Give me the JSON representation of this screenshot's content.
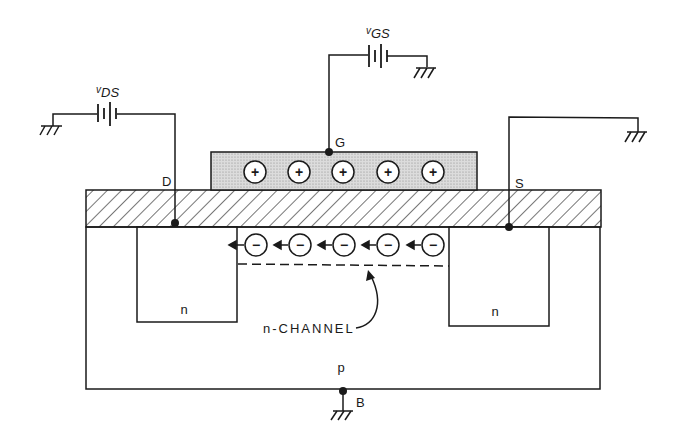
{
  "diagram": {
    "terminals": {
      "drain": "D",
      "gate": "G",
      "source": "S",
      "body": "B"
    },
    "sources": {
      "vds": {
        "main": "v",
        "sub": "DS"
      },
      "vgs": {
        "main": "v",
        "sub": "GS"
      }
    },
    "regions": {
      "drain_region": "n",
      "source_region": "n",
      "substrate": "p",
      "channel_label": "n-CHANNEL"
    },
    "gate_charges": [
      "+",
      "+",
      "+",
      "+",
      "+"
    ],
    "channel_charges": [
      "−",
      "−",
      "−",
      "−",
      "−"
    ],
    "colors": {
      "ink": "#1a1a1a",
      "gate_fill": "#d9d9d9",
      "background": "#ffffff"
    }
  }
}
